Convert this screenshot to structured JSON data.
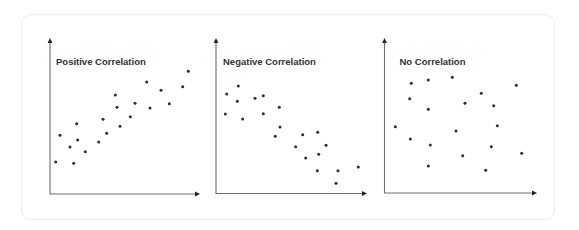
{
  "colors": {
    "axis": "#6e6e6e",
    "dot": "#2d2d2d",
    "title": "#333333",
    "card_border": "#ececec",
    "background": "#ffffff"
  },
  "chart_data": [
    {
      "type": "scatter",
      "title": "Positive Correlation",
      "xlabel": "",
      "ylabel": "",
      "grid": false,
      "legend": "none",
      "axes": {
        "origin": [
          50,
          194
        ],
        "x_end": 200,
        "y_end": 38
      },
      "points": [
        [
          55.7,
          162
        ],
        [
          60,
          135.3
        ],
        [
          70,
          147
        ],
        [
          73.7,
          163.3
        ],
        [
          76.7,
          123.7
        ],
        [
          77.7,
          140
        ],
        [
          85.3,
          151.7
        ],
        [
          98.7,
          142
        ],
        [
          103,
          119.3
        ],
        [
          106.7,
          133.3
        ],
        [
          115.3,
          95
        ],
        [
          117,
          107.3
        ],
        [
          120,
          126.3
        ],
        [
          130.3,
          116.7
        ],
        [
          135,
          103.3
        ],
        [
          146.7,
          82
        ],
        [
          150,
          108
        ],
        [
          161,
          90.3
        ],
        [
          169.3,
          103.7
        ],
        [
          182.7,
          86.7
        ],
        [
          188.3,
          71.3
        ]
      ]
    },
    {
      "type": "scatter",
      "title": "Negative Correlation",
      "xlabel": "",
      "ylabel": "",
      "grid": false,
      "legend": "none",
      "axes": {
        "origin": [
          216,
          193.5
        ],
        "x_end": 367,
        "y_end": 38
      },
      "points": [
        [
          226.7,
          94
        ],
        [
          225.3,
          114
        ],
        [
          238.3,
          86
        ],
        [
          237.3,
          101.3
        ],
        [
          242.7,
          119
        ],
        [
          255,
          98.3
        ],
        [
          263.3,
          95.7
        ],
        [
          263.3,
          113.7
        ],
        [
          279.3,
          107.3
        ],
        [
          280,
          127
        ],
        [
          275.3,
          136.3
        ],
        [
          295.7,
          146.7
        ],
        [
          302.7,
          134.7
        ],
        [
          305.7,
          158
        ],
        [
          317.7,
          132.3
        ],
        [
          318.7,
          154.3
        ],
        [
          317.3,
          170.7
        ],
        [
          326,
          145.3
        ],
        [
          336,
          183.3
        ],
        [
          338,
          170.7
        ],
        [
          358.3,
          167
        ]
      ]
    },
    {
      "type": "scatter",
      "title": "No Correlation",
      "xlabel": "",
      "ylabel": "",
      "grid": false,
      "legend": "none",
      "axes": {
        "origin": [
          384.5,
          193
        ],
        "x_end": 537,
        "y_end": 38
      },
      "points": [
        [
          395.3,
          126.7
        ],
        [
          409.7,
          98.7
        ],
        [
          410.3,
          139
        ],
        [
          411.3,
          83.3
        ],
        [
          428.3,
          80
        ],
        [
          428.3,
          109.3
        ],
        [
          428.3,
          166
        ],
        [
          430.3,
          145
        ],
        [
          452.3,
          77.3
        ],
        [
          456,
          131
        ],
        [
          462.7,
          155.7
        ],
        [
          465,
          103.3
        ],
        [
          481.3,
          93.3
        ],
        [
          485.7,
          170.3
        ],
        [
          491.3,
          146.7
        ],
        [
          493.7,
          105.7
        ],
        [
          497.3,
          125.7
        ],
        [
          516.3,
          85.3
        ],
        [
          521.7,
          153.3
        ]
      ]
    }
  ]
}
